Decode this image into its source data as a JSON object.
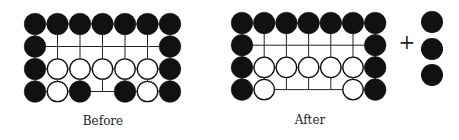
{
  "figure": {
    "boards": [
      {
        "id": "before",
        "label": "Before",
        "origin": {
          "x": 35,
          "y": 24
        },
        "spacing": 22.5,
        "rows": [
          "BBBBBBB",
          "B.....B",
          "BWWWWWB",
          "BWB.BWB"
        ]
      },
      {
        "id": "after",
        "label": "After",
        "origin": {
          "x": 242,
          "y": 23
        },
        "spacing": 22.2,
        "rows": [
          "BBBBBBB",
          "B.....B",
          "BWWWWWB",
          "BW...WB"
        ]
      }
    ],
    "plus_sign": "+",
    "captured": {
      "color": "black",
      "count": 3,
      "x": 432,
      "ys": [
        22,
        49,
        75
      ]
    },
    "colors": {
      "black_stone": "#111111",
      "white_stone": "#ffffff",
      "stone_outline": "#111111",
      "grid_line": "#222222"
    }
  }
}
